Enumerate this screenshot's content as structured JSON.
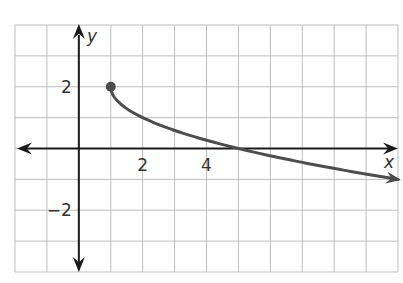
{
  "chart_data": {
    "type": "line",
    "title": "",
    "xlabel": "x",
    "ylabel": "y",
    "xlim": [
      -2,
      10
    ],
    "ylim": [
      -4,
      4
    ],
    "grid": true,
    "x_tick_labels": [
      {
        "value": 2,
        "label": "2"
      },
      {
        "value": 4,
        "label": "4"
      }
    ],
    "y_tick_labels": [
      {
        "value": 2,
        "label": "2"
      },
      {
        "value": -2,
        "label": "−2"
      }
    ],
    "series": [
      {
        "name": "y = -sqrt(x - 1) + 2",
        "start_point": {
          "x": 1,
          "y": 2,
          "closed": true
        },
        "end_arrow": true,
        "points": [
          {
            "x": 1,
            "y": 2
          },
          {
            "x": 1.25,
            "y": 1.5
          },
          {
            "x": 2,
            "y": 1
          },
          {
            "x": 3,
            "y": 0.586
          },
          {
            "x": 4,
            "y": 0.268
          },
          {
            "x": 5,
            "y": 0
          },
          {
            "x": 6,
            "y": -0.236
          },
          {
            "x": 7,
            "y": -0.449
          },
          {
            "x": 8,
            "y": -0.646
          },
          {
            "x": 9,
            "y": -0.828
          },
          {
            "x": 10,
            "y": -1
          }
        ]
      }
    ]
  },
  "colors": {
    "grid": "#bdbdbd",
    "axis": "#1a1a1a",
    "curve": "#4d4d4d",
    "text": "#333333"
  }
}
